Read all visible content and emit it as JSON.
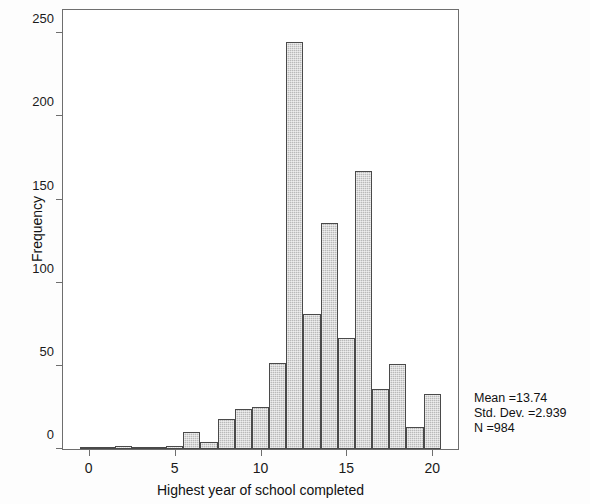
{
  "chart_data": {
    "type": "bar",
    "title": "",
    "subtitle": "",
    "xlabel": "Highest year of school completed",
    "ylabel": "Frequency",
    "xlim": [
      -1.5,
      21.5
    ],
    "ylim": [
      0,
      264
    ],
    "grid": false,
    "legend": null,
    "bar_width": 1,
    "x": [
      0,
      1,
      2,
      3,
      4,
      5,
      6,
      7,
      8,
      9,
      10,
      11,
      12,
      13,
      14,
      15,
      16,
      17,
      18,
      19,
      20
    ],
    "values": [
      1,
      1,
      2,
      1,
      1,
      2,
      10,
      4,
      18,
      24,
      25,
      52,
      245,
      81,
      136,
      67,
      167,
      36,
      51,
      13,
      33
    ],
    "categories": [
      "0",
      "1",
      "2",
      "3",
      "4",
      "5",
      "6",
      "7",
      "8",
      "9",
      "10",
      "11",
      "12",
      "13",
      "14",
      "15",
      "16",
      "17",
      "18",
      "19",
      "20"
    ],
    "xticks": [
      0,
      5,
      10,
      15,
      20
    ],
    "xtick_labels": [
      "0",
      "5",
      "10",
      "15",
      "20"
    ],
    "yticks": [
      0,
      50,
      100,
      150,
      200,
      250
    ],
    "ytick_labels": [
      "0",
      "50",
      "100",
      "150",
      "200",
      "250"
    ],
    "bar_fill_color": "#b9b9b9",
    "bar_edge_color": "#4a4a4a",
    "frame_color": "#6e6e6e",
    "annotations": [
      "Mean =13.74",
      "Std. Dev. =2.939",
      "N =984"
    ]
  },
  "stats": {
    "mean_line": "Mean =13.74",
    "sd_line": "Std. Dev. =2.939",
    "n_line": "N =984"
  }
}
